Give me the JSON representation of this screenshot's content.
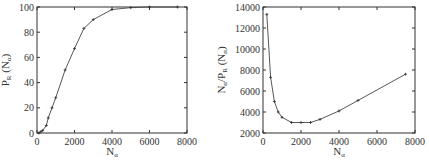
{
  "chart_data": [
    {
      "type": "line",
      "title": "",
      "xlabel": "N_α",
      "ylabel": "P_R (N_α)",
      "xlim": [
        0,
        8000
      ],
      "ylim": [
        0,
        100
      ],
      "xticks": [
        0,
        2000,
        4000,
        6000,
        8000
      ],
      "yticks": [
        0,
        20,
        40,
        60,
        80,
        100
      ],
      "grid": false,
      "legend": null,
      "x": [
        100,
        200,
        300,
        500,
        600,
        800,
        1000,
        1500,
        2000,
        2500,
        3000,
        4000,
        5000,
        6000,
        7500
      ],
      "series": [
        {
          "name": "P_R",
          "values": [
            0,
            1,
            2,
            6,
            12,
            20,
            28,
            50,
            67,
            83,
            90,
            98,
            99.5,
            100,
            100
          ]
        }
      ]
    },
    {
      "type": "line",
      "title": "",
      "xlabel": "N_α",
      "ylabel": "N_α/P_R (N_α)",
      "xlim": [
        0,
        8000
      ],
      "ylim": [
        2000,
        14000
      ],
      "xticks": [
        0,
        2000,
        4000,
        6000,
        8000
      ],
      "yticks": [
        2000,
        4000,
        6000,
        8000,
        10000,
        12000,
        14000
      ],
      "grid": false,
      "legend": null,
      "x": [
        200,
        400,
        600,
        800,
        1000,
        1500,
        2000,
        2500,
        3000,
        4000,
        5000,
        7500
      ],
      "series": [
        {
          "name": "N_α/P_R",
          "values": [
            13300,
            7300,
            5000,
            4000,
            3500,
            3000,
            3000,
            3000,
            3300,
            4100,
            5100,
            7600
          ]
        }
      ]
    }
  ],
  "labels": {
    "left_x_main": "N",
    "left_x_sub": "α",
    "left_y_main": "P",
    "left_y_sub": "R",
    "left_y_paren": " (N",
    "left_y_paren_sub": "α",
    "left_y_close": ")",
    "right_x_main": "N",
    "right_x_sub": "α",
    "right_y_main": "N",
    "right_y_sub1": "α",
    "right_y_mid": "/P",
    "right_y_sub2": "R",
    "right_y_paren": " (N",
    "right_y_paren_sub": "α",
    "right_y_close": ")"
  }
}
